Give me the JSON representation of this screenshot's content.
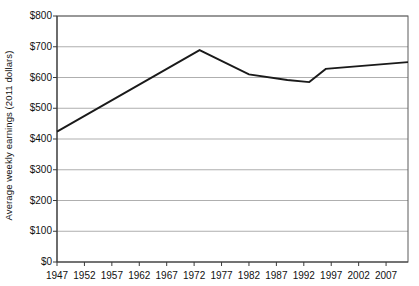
{
  "chart_data": {
    "type": "line",
    "title": "",
    "xlabel": "",
    "ylabel": "Average weekly earnings (2011 dollars)",
    "ylim": [
      0,
      800
    ],
    "xlim": [
      1947,
      2011
    ],
    "grid": true,
    "legend": "none",
    "y_tick_labels": [
      "$800",
      "$700",
      "$600",
      "$500",
      "$400",
      "$300",
      "$200",
      "$100",
      "$0"
    ],
    "y_tick_values": [
      800,
      700,
      600,
      500,
      400,
      300,
      200,
      100,
      0
    ],
    "x_tick_labels": [
      "1947",
      "1952",
      "1957",
      "1962",
      "1967",
      "1972",
      "1977",
      "1982",
      "1987",
      "1992",
      "1997",
      "2002",
      "2007"
    ],
    "x_tick_values": [
      1947,
      1952,
      1957,
      1962,
      1967,
      1972,
      1977,
      1982,
      1987,
      1992,
      1997,
      2002,
      2007
    ],
    "line_color": "#1a1a1a",
    "series": [
      {
        "name": "Average weekly earnings",
        "x": [
          1947,
          1973,
          1982,
          1989,
          1993,
          1996,
          2011
        ],
        "values": [
          424,
          689,
          610,
          592,
          585,
          628,
          650
        ]
      }
    ]
  },
  "axis": {
    "y_title": "Average weekly earnings (2011 dollars)"
  }
}
